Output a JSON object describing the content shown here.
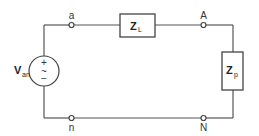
{
  "diagram": {
    "type": "circuit",
    "source": {
      "label": "V",
      "subscript": "an",
      "plus": "+",
      "tilde": "~",
      "minus": "−"
    },
    "line_impedance": {
      "label": "Z",
      "subscript": "L"
    },
    "load_impedance": {
      "label": "Z",
      "subscript": "p"
    },
    "nodes": {
      "a": "a",
      "A": "A",
      "n": "n",
      "N": "N"
    }
  }
}
